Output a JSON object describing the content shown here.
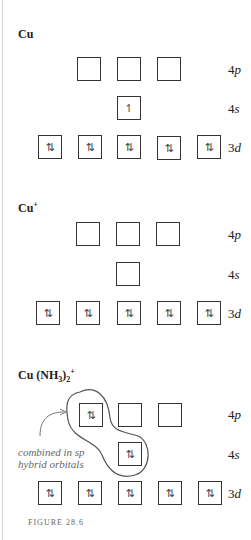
{
  "sections": [
    {
      "title": "Cu",
      "title_sup": "",
      "orbitals": {
        "4p": [
          "",
          "",
          ""
        ],
        "4s": [
          "↿"
        ],
        "3d": [
          "⇅",
          "⇅",
          "⇅",
          "⇅",
          "⇅"
        ]
      }
    },
    {
      "title": "Cu",
      "title_sup": "+",
      "orbitals": {
        "4p": [
          "",
          "",
          ""
        ],
        "4s": [
          ""
        ],
        "3d": [
          "⇅",
          "⇅",
          "⇅",
          "⇅",
          "⇅"
        ]
      }
    },
    {
      "title": "Cu (NH",
      "title_sub": "3",
      "title_close": ")",
      "title_sub2": "2",
      "title_sup": "+",
      "orbitals": {
        "4p": [
          "⇅",
          "",
          ""
        ],
        "4s": [
          "⇅"
        ],
        "3d": [
          "⇅",
          "⇅",
          "⇅",
          "⇅",
          "⇅"
        ]
      }
    }
  ],
  "labels": {
    "p": "4",
    "p_italic": "p",
    "s": "4",
    "s_italic": "s",
    "d": "3",
    "d_italic": "d"
  },
  "annotation": {
    "line1": "combined in sp",
    "line2": "hybrid orbitals"
  },
  "caption": "FIGURE 28.6"
}
